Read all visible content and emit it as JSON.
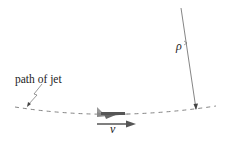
{
  "diagram": {
    "labels": {
      "path": "path of jet",
      "radius": "ρ",
      "velocity": "v"
    },
    "colors": {
      "line": "#555555",
      "text": "#222222",
      "jet": "#777777"
    }
  }
}
